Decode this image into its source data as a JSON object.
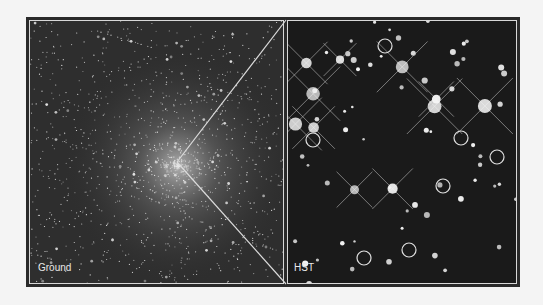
{
  "figure": {
    "left_panel": {
      "label": "Ground"
    },
    "right_panel": {
      "label": "HST"
    },
    "colors": {
      "frame": "#2a2a2a",
      "border_line": "#d8d8d8",
      "background": "#f4f4f4"
    },
    "circled_stars": [
      {
        "x": 385,
        "y": 46
      },
      {
        "x": 313,
        "y": 140
      },
      {
        "x": 461,
        "y": 138
      },
      {
        "x": 497,
        "y": 157
      },
      {
        "x": 443,
        "y": 186
      },
      {
        "x": 409,
        "y": 250
      },
      {
        "x": 364,
        "y": 258
      }
    ],
    "zoom_vertex": {
      "x": 177,
      "y": 162
    }
  }
}
